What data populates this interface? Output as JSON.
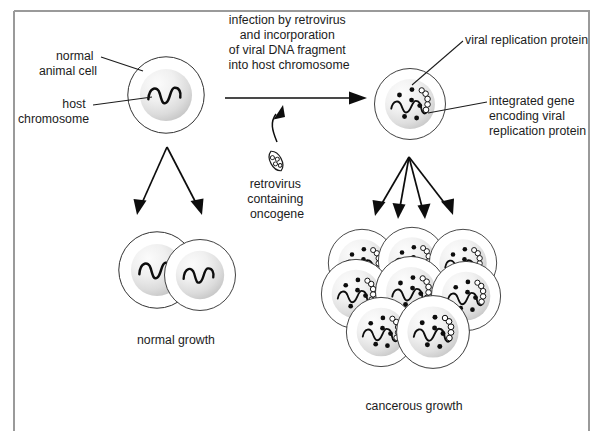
{
  "figure": {
    "kind": "biology-diagram",
    "frame_color": "#9a9a9a",
    "ink_color": "#1c1c1c"
  },
  "labels": {
    "normal_animal_cell": "normal\nanimal cell",
    "normal_animal_cell_l1": "normal",
    "normal_animal_cell_l2": "animal cell",
    "host_chromosome_l1": "host",
    "host_chromosome_l2": "chromosome",
    "infection_caption_l1": "infection by retrovirus",
    "infection_caption_l2": "and incorporation",
    "infection_caption_l3": "of viral DNA fragment",
    "infection_caption_l4": "into host chromosome",
    "retrovirus_caption_l1": "retrovirus",
    "retrovirus_caption_l2": "containing",
    "retrovirus_caption_l3": "oncogene",
    "viral_replication_protein": "viral replication protein",
    "integrated_gene_l1": "integrated gene",
    "integrated_gene_l2": "encoding viral",
    "integrated_gene_l3": "replication protein",
    "normal_growth": "normal growth",
    "cancerous_growth": "cancerous growth"
  },
  "icons": {
    "retrovirus": "retrovirus-particle-icon",
    "chromosome": "wavy-chromosome-icon",
    "protein": "protein-dot-icon",
    "integrated_gene": "beaded-gene-coil-icon"
  },
  "diagram_data": {
    "type": "process-flow",
    "stages": [
      {
        "id": "normal-cell",
        "label": "normal animal cell",
        "cell_count": 1,
        "has_viral_gene": false,
        "protein_dots": 0,
        "center": [
          166,
          95
        ],
        "wall_radius": 42,
        "nucleus_radius": 28
      },
      {
        "id": "normal-growth",
        "label": "normal growth",
        "cell_count": 2,
        "has_viral_gene": false,
        "protein_dots": 0
      },
      {
        "id": "infected-cell",
        "label": "integrated gene encoding viral replication protein",
        "cell_count": 1,
        "has_viral_gene": true,
        "protein_dots": 6,
        "center": [
          409,
          103
        ],
        "wall_radius": 38,
        "nucleus_radius": 26
      },
      {
        "id": "cancerous-growth",
        "label": "cancerous growth",
        "cell_count": 8,
        "has_viral_gene": true,
        "protein_dots": 6,
        "rows": [
          3,
          3,
          2
        ]
      }
    ],
    "transitions": [
      {
        "from": "normal-cell",
        "to": "infected-cell",
        "label": "infection by retrovirus and incorporation of viral DNA fragment into host chromosome",
        "agent": "retrovirus containing oncogene",
        "style": "straight-arrow"
      },
      {
        "from": "normal-cell",
        "to": "normal-growth",
        "arrow_count": 2,
        "style": "fan-arrows"
      },
      {
        "from": "infected-cell",
        "to": "cancerous-growth",
        "arrow_count": 4,
        "style": "fan-arrows"
      }
    ]
  }
}
